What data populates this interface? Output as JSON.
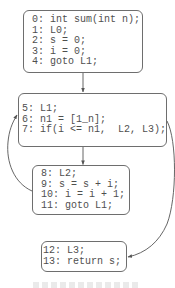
{
  "diagram": {
    "type": "control-flow-graph",
    "nodes": [
      {
        "id": "entry",
        "lines": [
          "0: int sum(int n);",
          "1: L0;",
          "2: s = 0;",
          "3: i = 0;",
          "4: goto L1;"
        ]
      },
      {
        "id": "loop-header",
        "lines": [
          "5: L1;",
          "6: n1 = [1_n];",
          "7: if(i <= n1,  L2, L3);"
        ]
      },
      {
        "id": "loop-body",
        "lines": [
          "8: L2;",
          "9: s = s + i;",
          "10: i = i + 1;",
          "11: goto L1;"
        ]
      },
      {
        "id": "exit",
        "lines": [
          "12: L3;",
          "13: return s;"
        ]
      }
    ],
    "edges": [
      {
        "from": "entry",
        "to": "loop-header"
      },
      {
        "from": "loop-header",
        "to": "loop-body"
      },
      {
        "from": "loop-body",
        "to": "loop-header"
      },
      {
        "from": "loop-header",
        "to": "exit"
      }
    ]
  },
  "colors": {
    "background": "#ffffff",
    "node_border": "#6e6e6e",
    "text": "#4f4f4f",
    "edge": "#555555"
  }
}
